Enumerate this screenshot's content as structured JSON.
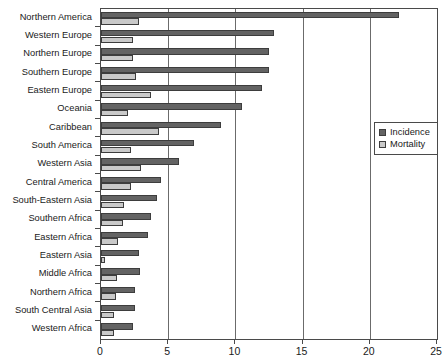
{
  "chart_data": {
    "type": "bar",
    "title": "",
    "subtitle": "",
    "orientation": "horizontal",
    "xlabel": "",
    "ylabel": "",
    "xlim": [
      0,
      25
    ],
    "xticks": [
      0,
      5,
      10,
      15,
      20,
      25
    ],
    "xtick_labels": [
      "0",
      "5",
      "10",
      "15",
      "20",
      "25"
    ],
    "grid": "vertical gridlines at 5, 10, 15, 20",
    "legend_position": "right-middle",
    "categories": [
      "Northern America",
      "Western Europe",
      "Northern Europe",
      "Southern Europe",
      "Eastern Europe",
      "Oceania",
      "Caribbean",
      "South America",
      "Western Asia",
      "Central America",
      "South-Eastern Asia",
      "Southern Africa",
      "Eastern Africa",
      "Eastern Asia",
      "Middle Africa",
      "Northern Africa",
      "South Central Asia",
      "Western Africa"
    ],
    "series": [
      {
        "name": "Incidence",
        "color": "#636363",
        "values": [
          22.2,
          12.9,
          12.5,
          12.5,
          12.0,
          10.5,
          8.9,
          6.9,
          5.8,
          4.5,
          4.2,
          3.7,
          3.5,
          2.8,
          2.9,
          2.5,
          2.5,
          2.4
        ]
      },
      {
        "name": "Mortality",
        "color": "#c9c9c9",
        "values": [
          2.8,
          2.4,
          2.4,
          2.6,
          3.7,
          2.0,
          4.3,
          2.2,
          3.0,
          2.2,
          1.7,
          1.6,
          1.3,
          0.3,
          1.2,
          1.1,
          1.0,
          1.0
        ]
      }
    ]
  },
  "legend": {
    "items": [
      {
        "label": "Incidence"
      },
      {
        "label": "Mortality"
      }
    ]
  }
}
